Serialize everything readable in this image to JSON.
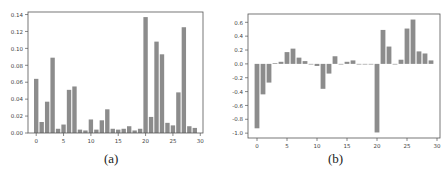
{
  "chart_data": [
    {
      "type": "bar",
      "caption": "(a)",
      "title": "",
      "xlabel": "",
      "ylabel": "",
      "x": [
        0,
        1,
        2,
        3,
        4,
        5,
        6,
        7,
        8,
        9,
        10,
        11,
        12,
        13,
        14,
        15,
        16,
        17,
        18,
        19,
        20,
        21,
        22,
        23,
        24,
        25,
        26,
        27,
        28,
        29
      ],
      "values": [
        0.064,
        0.013,
        0.037,
        0.089,
        0.005,
        0.01,
        0.051,
        0.055,
        0.004,
        0.003,
        0.016,
        0.004,
        0.015,
        0.028,
        0.005,
        0.004,
        0.005,
        0.008,
        0.003,
        0.005,
        0.137,
        0.019,
        0.108,
        0.093,
        0.012,
        0.009,
        0.048,
        0.125,
        0.008,
        0.006
      ],
      "xticks": [
        0,
        5,
        10,
        15,
        20,
        25,
        30
      ],
      "xtick_labels": [
        "0",
        "5",
        "10",
        "15",
        "20",
        "25",
        "30"
      ],
      "yticks": [
        0.0,
        0.02,
        0.04,
        0.06,
        0.08,
        0.1,
        0.12,
        0.14
      ],
      "ytick_labels": [
        "0.00",
        "0.02",
        "0.04",
        "0.06",
        "0.08",
        "0.10",
        "0.12",
        "0.14"
      ],
      "xlim": [
        -1.5,
        30.5
      ],
      "ylim": [
        0,
        0.143
      ],
      "bar_color": "#8c8c8c",
      "grid": false,
      "legend": null
    },
    {
      "type": "bar",
      "caption": "(b)",
      "title": "",
      "xlabel": "",
      "ylabel": "",
      "x": [
        0,
        1,
        2,
        3,
        4,
        5,
        6,
        7,
        8,
        9,
        10,
        11,
        12,
        13,
        14,
        15,
        16,
        17,
        18,
        19,
        20,
        21,
        22,
        23,
        24,
        25,
        26,
        27,
        28,
        29
      ],
      "values": [
        -0.93,
        -0.44,
        -0.27,
        0.01,
        0.03,
        0.17,
        0.22,
        0.09,
        0.04,
        0.0,
        -0.03,
        -0.36,
        -0.14,
        0.11,
        0.0,
        0.03,
        0.05,
        0.0,
        0.0,
        0.0,
        -0.99,
        0.49,
        0.25,
        0.0,
        0.06,
        0.51,
        0.64,
        0.18,
        0.15,
        0.05
      ],
      "xticks": [
        0,
        5,
        10,
        15,
        20,
        25,
        30
      ],
      "xtick_labels": [
        "0",
        "5",
        "10",
        "15",
        "20",
        "25",
        "30"
      ],
      "yticks": [
        -1.0,
        -0.8,
        -0.6,
        -0.4,
        -0.2,
        0.0,
        0.2,
        0.4,
        0.6
      ],
      "ytick_labels": [
        "-1.0",
        "-0.8",
        "-0.6",
        "-0.4",
        "-0.2",
        "0.0",
        "0.2",
        "0.4",
        "0.6"
      ],
      "xlim": [
        -1.5,
        30.5
      ],
      "ylim": [
        -1.07,
        0.72
      ],
      "bar_color": "#8c8c8c",
      "grid": false,
      "legend": null
    }
  ]
}
